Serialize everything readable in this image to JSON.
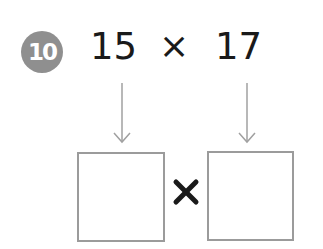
{
  "problem": {
    "number_label": "10",
    "operand_1": "15",
    "operator": "×",
    "operand_2": "17"
  },
  "answer_row": {
    "operator": "×",
    "box_left_value": "",
    "box_right_value": ""
  },
  "colors": {
    "badge_bg": "#8f8f8f",
    "text": "#1a1a1a",
    "arrow": "#a0a0a0",
    "box_border": "#9b9b9b"
  }
}
